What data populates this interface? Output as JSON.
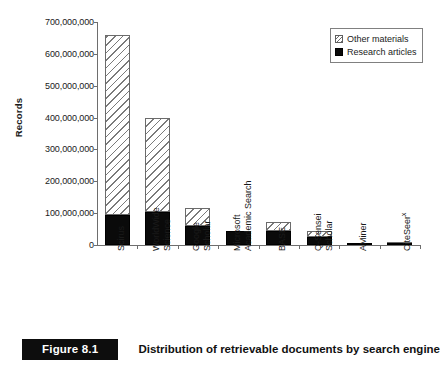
{
  "figure": {
    "tag": "Figure 8.1",
    "caption": "Distribution of retrievable documents by search engine"
  },
  "chart_data": {
    "type": "bar",
    "stacked": true,
    "title": "",
    "subtitle": "",
    "xlabel": "",
    "ylabel": "Records",
    "ylim": [
      0,
      700000000
    ],
    "ytick_values": [
      0,
      100000000,
      200000000,
      300000000,
      400000000,
      500000000,
      600000000,
      700000000
    ],
    "ytick_labels": [
      "0",
      "100,000,000",
      "200,000,000",
      "300,000,000",
      "400,000,000",
      "500,000,000",
      "600,000,000",
      "700,000,000"
    ],
    "grid": false,
    "legend_position": "top-right",
    "categories": [
      "Scirus",
      "WorldWide\nScience",
      "Google\nScholar",
      "Microsoft\nAcademic Search",
      "BASE",
      "Q-Sensei\nScholar",
      "AMiner",
      "CiteSeer"
    ],
    "category_superscripts": [
      "",
      "",
      "",
      "",
      "",
      "",
      "",
      "x"
    ],
    "series": [
      {
        "name": "Research articles",
        "fill": "solid-black",
        "color": "#0a0a0a",
        "values": [
          95000000,
          105000000,
          60000000,
          45000000,
          45000000,
          25000000,
          3000000,
          3000000
        ]
      },
      {
        "name": "Other materials",
        "fill": "hatched",
        "color": "#ffffff",
        "values": [
          565000000,
          295000000,
          57000000,
          0,
          27000000,
          20000000,
          0,
          1000000
        ]
      }
    ],
    "totals": [
      660000000,
      400000000,
      117000000,
      45000000,
      72000000,
      45000000,
      3000000,
      4000000
    ]
  },
  "legend": {
    "items": [
      {
        "label": "Other materials"
      },
      {
        "label": "Research articles"
      }
    ]
  }
}
